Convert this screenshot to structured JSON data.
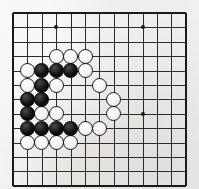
{
  "board": {
    "title": "Go board diagram",
    "type": "go-board",
    "columns": 13,
    "rows": 13,
    "origin_x": 13,
    "origin_y": 13,
    "cell_size": 14.4,
    "stone_diameter": 15,
    "line_color": "#2b2b2b",
    "edge_color": "#1a1a1a",
    "background_color": "#f2f1ef",
    "black_color": "#000000",
    "white_color": "#ffffff",
    "star_points": [
      {
        "col": 3,
        "row": 1
      },
      {
        "col": 9,
        "row": 1
      },
      {
        "col": 9,
        "row": 7
      }
    ],
    "stones": [
      {
        "color": "white",
        "col": 3,
        "row": 3
      },
      {
        "color": "white",
        "col": 4,
        "row": 3
      },
      {
        "color": "white",
        "col": 5,
        "row": 3
      },
      {
        "color": "white",
        "col": 1,
        "row": 4
      },
      {
        "color": "black",
        "col": 2,
        "row": 4
      },
      {
        "color": "black",
        "col": 3,
        "row": 4
      },
      {
        "color": "black",
        "col": 4,
        "row": 4
      },
      {
        "color": "white",
        "col": 5,
        "row": 4
      },
      {
        "color": "white",
        "col": 1,
        "row": 5
      },
      {
        "color": "black",
        "col": 2,
        "row": 5
      },
      {
        "color": "white",
        "col": 3,
        "row": 5
      },
      {
        "color": "white",
        "col": 6,
        "row": 5
      },
      {
        "color": "black",
        "col": 1,
        "row": 6
      },
      {
        "color": "black",
        "col": 2,
        "row": 6
      },
      {
        "color": "white",
        "col": 7,
        "row": 6
      },
      {
        "color": "black",
        "col": 1,
        "row": 7
      },
      {
        "color": "white",
        "col": 2,
        "row": 7
      },
      {
        "color": "white",
        "col": 3,
        "row": 7
      },
      {
        "color": "white",
        "col": 7,
        "row": 7
      },
      {
        "color": "black",
        "col": 1,
        "row": 8
      },
      {
        "color": "black",
        "col": 2,
        "row": 8
      },
      {
        "color": "black",
        "col": 3,
        "row": 8
      },
      {
        "color": "black",
        "col": 4,
        "row": 8
      },
      {
        "color": "white",
        "col": 5,
        "row": 8
      },
      {
        "color": "white",
        "col": 6,
        "row": 8
      },
      {
        "color": "white",
        "col": 1,
        "row": 9
      },
      {
        "color": "white",
        "col": 2,
        "row": 9
      },
      {
        "color": "white",
        "col": 3,
        "row": 9
      },
      {
        "color": "white",
        "col": 4,
        "row": 9
      }
    ]
  }
}
